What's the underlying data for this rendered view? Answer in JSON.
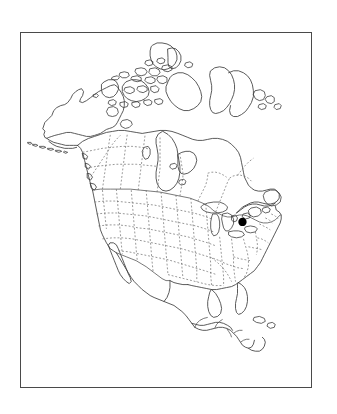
{
  "figure": {
    "type": "locator-map",
    "region": "North America",
    "background_color": "#ffffff",
    "frame": {
      "name": "map-frame",
      "x": 20,
      "y": 32,
      "width": 292,
      "height": 356,
      "stroke_color": "#4a4a4a",
      "stroke_width": 1.2,
      "fill_color": "#ffffff"
    },
    "title": "",
    "caption": "",
    "scale_bar": "",
    "north_arrow": "",
    "legend": [],
    "axis_labels": [],
    "text_labels": []
  },
  "map": {
    "projection_note": "conic, North America centered",
    "coastline": {
      "name": "coastline",
      "stroke_color": "#3c3c3c",
      "stroke_width": 0.85,
      "fill": "none"
    },
    "national_borders": {
      "name": "national-borders",
      "stroke_color": "#4a4a4a",
      "stroke_width": 0.75,
      "style": "solid"
    },
    "subnational_borders": {
      "name": "subnational-borders",
      "stroke_color": "#6e6e6e",
      "stroke_width": 0.72,
      "style": "dotted",
      "dash_pattern": "1.9 1.9"
    },
    "lakes": {
      "name": "great-lakes",
      "stroke_color": "#3c3c3c",
      "stroke_width": 0.8
    },
    "landmasses": [
      "Alaska",
      "Canada",
      "Canadian Arctic Archipelago",
      "Greenland (western edge)",
      "Contiguous United States",
      "Mexico",
      "Central America",
      "Yucatan Peninsula",
      "Newfoundland",
      "Baja California",
      "Florida Peninsula",
      "Aleutian Islands"
    ],
    "water_features": [
      "Hudson Bay",
      "Great Lakes",
      "Gulf of Mexico",
      "Great Slave Lake",
      "Great Bear Lake",
      "Lake Winnipeg"
    ]
  },
  "markers": [
    {
      "name": "study-site-marker",
      "shape": "filled-circle",
      "color": "#000000",
      "radius_px": 4.2,
      "x_px": 223,
      "y_px": 190,
      "label": "",
      "description": "Single solid black dot in the mid-Atlantic United States"
    }
  ]
}
